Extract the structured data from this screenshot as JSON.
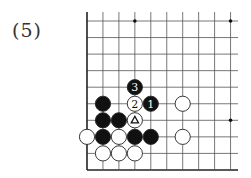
{
  "diagram": {
    "label": "(5)",
    "board": {
      "cols": 10,
      "rows": 10,
      "origin_x": 87,
      "origin_y": 21,
      "col_spacing": 15.95,
      "row_spacing": 16.55,
      "left_edge": true,
      "bottom_edge": true,
      "line_color": "#555555",
      "edge_color": "#222222"
    },
    "star_points": [
      {
        "col": 3,
        "row": 0
      },
      {
        "col": 9,
        "row": 0
      },
      {
        "col": 9,
        "row": 6
      }
    ],
    "stones": [
      {
        "col": 3,
        "row": 4,
        "color": "black",
        "mark": "3"
      },
      {
        "col": 1,
        "row": 5,
        "color": "black",
        "mark": ""
      },
      {
        "col": 3,
        "row": 5,
        "color": "white",
        "mark": "2"
      },
      {
        "col": 4,
        "row": 5,
        "color": "black",
        "mark": "1"
      },
      {
        "col": 6,
        "row": 5,
        "color": "white",
        "mark": ""
      },
      {
        "col": 1,
        "row": 6,
        "color": "black",
        "mark": ""
      },
      {
        "col": 2,
        "row": 6,
        "color": "black",
        "mark": ""
      },
      {
        "col": 3,
        "row": 6,
        "color": "white",
        "mark": "triangle"
      },
      {
        "col": 0,
        "row": 7,
        "color": "white",
        "mark": ""
      },
      {
        "col": 1,
        "row": 7,
        "color": "black",
        "mark": ""
      },
      {
        "col": 2,
        "row": 7,
        "color": "white",
        "mark": ""
      },
      {
        "col": 3,
        "row": 7,
        "color": "black",
        "mark": ""
      },
      {
        "col": 4,
        "row": 7,
        "color": "black",
        "mark": ""
      },
      {
        "col": 6,
        "row": 7,
        "color": "white",
        "mark": ""
      },
      {
        "col": 1,
        "row": 8,
        "color": "white",
        "mark": ""
      },
      {
        "col": 2,
        "row": 8,
        "color": "white",
        "mark": ""
      },
      {
        "col": 3,
        "row": 8,
        "color": "white",
        "mark": ""
      }
    ]
  }
}
